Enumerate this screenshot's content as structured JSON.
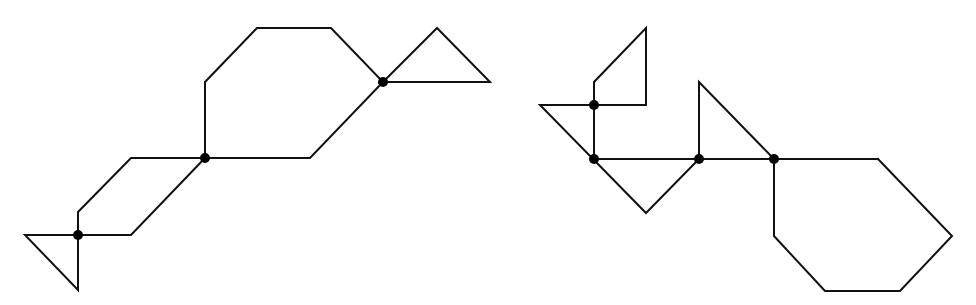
{
  "diagram": {
    "stroke_color": "#111111",
    "node_color": "#000000",
    "background": "#ffffff",
    "figures": [
      {
        "id": "left-figure",
        "shapes": [
          {
            "name": "hexagon",
            "points": [
              [
                205,
                82
              ],
              [
                257,
                28
              ],
              [
                331,
                28
              ],
              [
                383,
                82
              ],
              [
                310,
                158
              ],
              [
                205,
                158
              ]
            ]
          },
          {
            "name": "triangle-upper-right",
            "points": [
              [
                383,
                82
              ],
              [
                437,
                28
              ],
              [
                490,
                82
              ]
            ]
          },
          {
            "name": "parallelogram",
            "points": [
              [
                205,
                158
              ],
              [
                131,
                158
              ],
              [
                78,
                212
              ],
              [
                78,
                235
              ],
              [
                131,
                235
              ]
            ]
          },
          {
            "name": "triangle-lower-left",
            "points": [
              [
                78,
                235
              ],
              [
                25,
                235
              ],
              [
                78,
                290
              ]
            ]
          }
        ],
        "nodes": [
          [
            383,
            82
          ],
          [
            205,
            158
          ],
          [
            78,
            235
          ]
        ]
      },
      {
        "id": "right-figure",
        "shapes": [
          {
            "name": "pentagon-top",
            "points": [
              [
                594,
                105
              ],
              [
                594,
                82
              ],
              [
                646,
                28
              ],
              [
                646,
                105
              ]
            ]
          },
          {
            "name": "triangle-left-large",
            "points": [
              [
                540,
                105
              ],
              [
                594,
                105
              ],
              [
                594,
                159
              ]
            ],
            "extra_path": [
              [
                540,
                105
              ],
              [
                646,
                213
              ],
              [
                699,
                159
              ]
            ]
          },
          {
            "name": "square-bottom",
            "points": [
              [
                594,
                159
              ],
              [
                699,
                159
              ],
              [
                646,
                213
              ]
            ]
          },
          {
            "name": "triangle-middle",
            "points": [
              [
                699,
                159
              ],
              [
                699,
                82
              ],
              [
                774,
                159
              ]
            ]
          },
          {
            "name": "hexagon",
            "points": [
              [
                774,
                159
              ],
              [
                878,
                159
              ],
              [
                952,
                236
              ],
              [
                900,
                291
              ],
              [
                825,
                291
              ],
              [
                774,
                236
              ]
            ]
          }
        ],
        "nodes": [
          [
            594,
            105
          ],
          [
            594,
            159
          ],
          [
            699,
            159
          ],
          [
            774,
            159
          ]
        ]
      }
    ]
  }
}
